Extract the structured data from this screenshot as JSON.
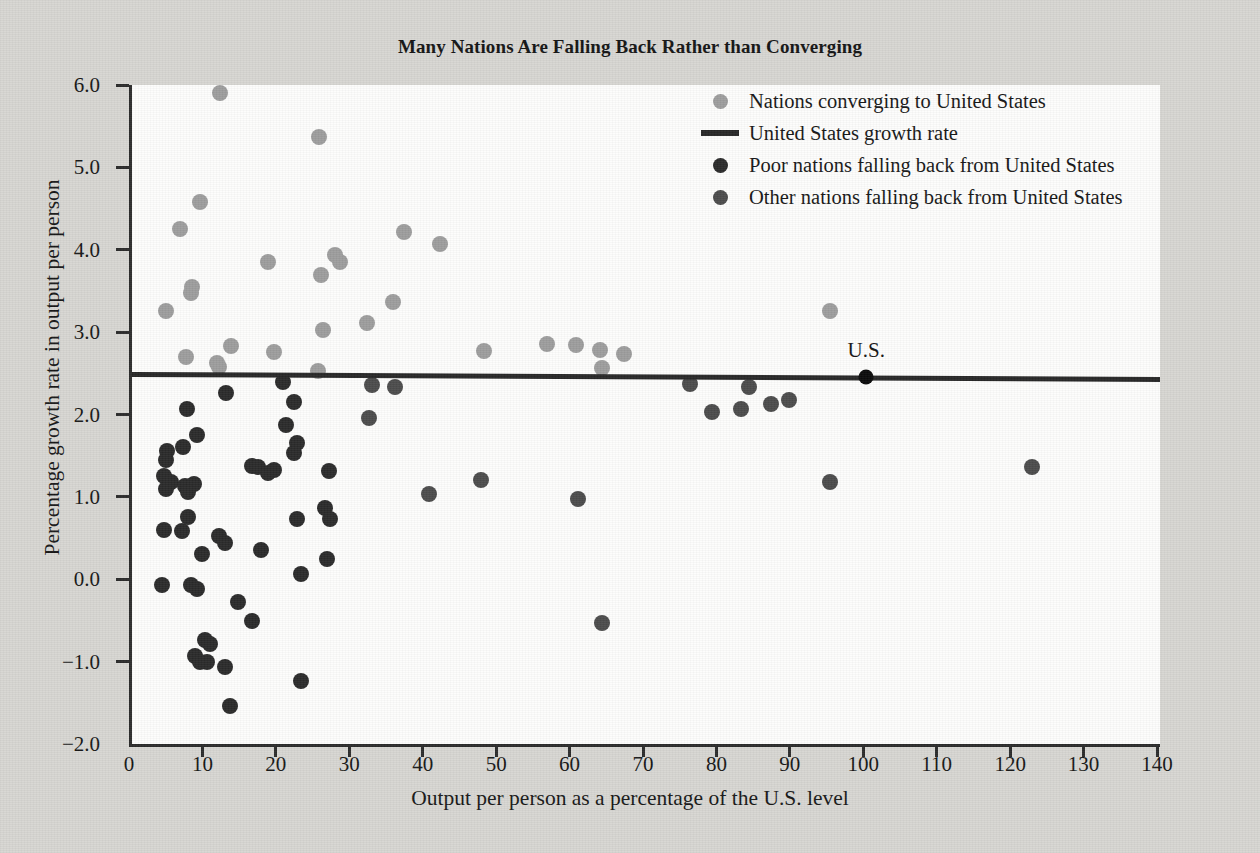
{
  "chart_data": {
    "type": "scatter",
    "title": "Many Nations Are Falling Back Rather than Converging",
    "xlabel": "Output per person as a percentage of the U.S. level",
    "ylabel": "Percentage growth rate in output per person",
    "xlim": [
      0,
      140
    ],
    "ylim": [
      -2.0,
      6.0
    ],
    "xticks": [
      0,
      10,
      20,
      30,
      40,
      50,
      60,
      70,
      80,
      90,
      100,
      110,
      120,
      130,
      140
    ],
    "xtick_labels": [
      "0",
      "10",
      "20",
      "30",
      "40",
      "50",
      "60",
      "70",
      "80",
      "90",
      "100",
      "110",
      "120",
      "130",
      "140"
    ],
    "yticks": [
      -2.0,
      -1.0,
      0.0,
      1.0,
      2.0,
      3.0,
      4.0,
      5.0,
      6.0
    ],
    "ytick_labels": [
      "−2.0",
      "−1.0",
      "0.0",
      "1.0",
      "2.0",
      "3.0",
      "4.0",
      "5.0",
      "6.0"
    ],
    "grid": false,
    "legend_position": "top-right",
    "colors": {
      "converging": "#9d9d9d",
      "us_line": "#272727",
      "poor": "#2a2a2a",
      "other": "#4b4b4b",
      "us_point": "#0a0a0a",
      "plot_background": "#fdfdfc",
      "page_background": "#d7d6d2",
      "axis": "#2b2b2b"
    },
    "reference_line": {
      "name": "United States growth rate",
      "y_at_xmin": 2.48,
      "y_at_xmax": 2.42
    },
    "annotations": [
      {
        "text": "U.S.",
        "x": 100,
        "y": 2.45
      }
    ],
    "legend": [
      {
        "marker": "circle",
        "color": "#9d9d9d",
        "label": "Nations converging to United States"
      },
      {
        "marker": "line",
        "color": "#272727",
        "label": "United States growth rate"
      },
      {
        "marker": "circle",
        "color": "#2a2a2a",
        "label": "Poor nations falling back from United States"
      },
      {
        "marker": "circle",
        "color": "#4b4b4b",
        "label": "Other nations falling back from United States"
      }
    ],
    "series": [
      {
        "name": "Nations converging to United States",
        "color": "#9d9d9d",
        "points": [
          [
            12.0,
            5.9
          ],
          [
            25.5,
            5.37
          ],
          [
            9.3,
            4.58
          ],
          [
            6.5,
            4.25
          ],
          [
            37.0,
            4.21
          ],
          [
            42.0,
            4.07
          ],
          [
            27.7,
            3.94
          ],
          [
            28.3,
            3.85
          ],
          [
            18.5,
            3.85
          ],
          [
            25.8,
            3.69
          ],
          [
            8.2,
            3.55
          ],
          [
            8.0,
            3.47
          ],
          [
            4.6,
            3.26
          ],
          [
            95.0,
            3.26
          ],
          [
            35.5,
            3.36
          ],
          [
            32.0,
            3.11
          ],
          [
            26.0,
            3.03
          ],
          [
            13.5,
            2.83
          ],
          [
            19.3,
            2.76
          ],
          [
            48.0,
            2.77
          ],
          [
            56.5,
            2.85
          ],
          [
            60.5,
            2.84
          ],
          [
            63.8,
            2.78
          ],
          [
            67.0,
            2.73
          ],
          [
            7.3,
            2.7
          ],
          [
            11.6,
            2.63
          ],
          [
            11.9,
            2.58
          ],
          [
            64.0,
            2.57
          ],
          [
            25.3,
            2.53
          ]
        ]
      },
      {
        "name": "Poor nations falling back from United States",
        "color": "#2a2a2a",
        "points": [
          [
            7.5,
            2.07
          ],
          [
            12.8,
            2.26
          ],
          [
            20.5,
            2.4
          ],
          [
            22.0,
            2.15
          ],
          [
            21.0,
            1.87
          ],
          [
            22.5,
            1.66
          ],
          [
            22.0,
            1.53
          ],
          [
            8.8,
            1.75
          ],
          [
            4.8,
            1.56
          ],
          [
            6.9,
            1.6
          ],
          [
            4.6,
            1.45
          ],
          [
            16.3,
            1.38
          ],
          [
            17.2,
            1.36
          ],
          [
            18.5,
            1.29
          ],
          [
            19.3,
            1.33
          ],
          [
            26.8,
            1.32
          ],
          [
            4.4,
            1.25
          ],
          [
            5.3,
            1.18
          ],
          [
            7.2,
            1.13
          ],
          [
            8.4,
            1.16
          ],
          [
            4.6,
            1.09
          ],
          [
            7.6,
            1.06
          ],
          [
            22.5,
            0.73
          ],
          [
            26.3,
            0.86
          ],
          [
            27.0,
            0.73
          ],
          [
            7.6,
            0.76
          ],
          [
            4.3,
            0.6
          ],
          [
            6.8,
            0.58
          ],
          [
            11.9,
            0.52
          ],
          [
            12.6,
            0.44
          ],
          [
            9.5,
            0.31
          ],
          [
            17.5,
            0.35
          ],
          [
            26.5,
            0.25
          ],
          [
            23.0,
            0.06
          ],
          [
            4.1,
            -0.07
          ],
          [
            8.1,
            -0.07
          ],
          [
            8.9,
            -0.12
          ],
          [
            14.5,
            -0.28
          ],
          [
            16.3,
            -0.51
          ],
          [
            10.0,
            -0.74
          ],
          [
            10.6,
            -0.79
          ],
          [
            8.6,
            -0.93
          ],
          [
            9.3,
            -1.0
          ],
          [
            10.2,
            -1.01
          ],
          [
            12.6,
            -1.06
          ],
          [
            23.0,
            -1.24
          ],
          [
            13.3,
            -1.54
          ]
        ]
      },
      {
        "name": "Other nations falling back from United States",
        "color": "#4b4b4b",
        "points": [
          [
            32.7,
            2.36
          ],
          [
            35.8,
            2.33
          ],
          [
            76.0,
            2.37
          ],
          [
            84.0,
            2.33
          ],
          [
            87.0,
            2.13
          ],
          [
            89.5,
            2.17
          ],
          [
            83.0,
            2.07
          ],
          [
            79.0,
            2.03
          ],
          [
            32.3,
            1.96
          ],
          [
            40.5,
            1.04
          ],
          [
            47.5,
            1.21
          ],
          [
            60.8,
            0.98
          ],
          [
            95.0,
            1.18
          ],
          [
            122.5,
            1.36
          ],
          [
            64.0,
            -0.53
          ]
        ]
      },
      {
        "name": "United States",
        "color": "#0a0a0a",
        "points": [
          [
            100.0,
            2.45
          ]
        ]
      }
    ]
  }
}
